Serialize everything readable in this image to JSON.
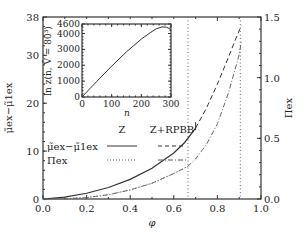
{
  "chart_data": {
    "type": "line",
    "title": "",
    "xlabel": "φ",
    "ylabel_left": "μ̃ex − μ̃1ex",
    "ylabel_right": "Πex",
    "xlim": [
      0.0,
      1.0
    ],
    "ylim_left": [
      0,
      38
    ],
    "ylim_right": [
      0.0,
      1.5
    ],
    "x_ticks": [
      "0.0",
      "0.2",
      "0.4",
      "0.6",
      "0.8",
      "1.0"
    ],
    "y_left_ticks": [
      "0",
      "10",
      "20",
      "30",
      "38"
    ],
    "y_right_ticks": [
      "0.0",
      "0.5",
      "1.0",
      "1.5"
    ],
    "grid": false,
    "vertical_lines": [
      {
        "x": 0.665,
        "style": "dotted"
      },
      {
        "x": 0.905,
        "style": "dotted"
      }
    ],
    "legend": {
      "position": "upper-left",
      "columns": [
        "Z",
        "Z+RPBB"
      ],
      "rows": [
        "μ̃ex−μ̃1ex",
        "Πex"
      ]
    },
    "series": [
      {
        "name": "μ̃ex−μ̃1ex (Z)",
        "axis": "left",
        "style": "solid",
        "x": [
          0.0,
          0.1,
          0.2,
          0.3,
          0.4,
          0.5,
          0.6,
          0.65,
          0.7
        ],
        "y": [
          0.0,
          0.4,
          1.2,
          2.4,
          4.1,
          6.4,
          9.6,
          11.8,
          14.8
        ]
      },
      {
        "name": "μ̃ex−μ̃1ex (Z+RPBB)",
        "axis": "left",
        "style": "dashed",
        "x": [
          0.7,
          0.75,
          0.8,
          0.85,
          0.88,
          0.91
        ],
        "y": [
          14.8,
          19.0,
          24.0,
          29.5,
          33.0,
          36.2
        ]
      },
      {
        "name": "Πex (Z)",
        "axis": "right",
        "style": "dotted",
        "x": [
          0.0,
          0.1,
          0.2,
          0.3,
          0.4,
          0.5,
          0.6,
          0.665
        ],
        "y": [
          0.0,
          0.002,
          0.012,
          0.035,
          0.075,
          0.13,
          0.21,
          0.27
        ]
      },
      {
        "name": "Πex (Z+RPBB)",
        "axis": "right",
        "style": "dashdot",
        "x": [
          0.0,
          0.1,
          0.2,
          0.3,
          0.4,
          0.5,
          0.6,
          0.665,
          0.7,
          0.75,
          0.8,
          0.85,
          0.9,
          0.91
        ],
        "y": [
          0.0,
          0.002,
          0.012,
          0.035,
          0.075,
          0.13,
          0.21,
          0.27,
          0.33,
          0.45,
          0.62,
          0.87,
          1.19,
          1.3
        ]
      }
    ],
    "inset": {
      "type": "line",
      "xlabel": "n",
      "ylabel": "ln z(n, V̄ = 80³)",
      "xlim": [
        0,
        300
      ],
      "ylim": [
        0,
        4600
      ],
      "x_ticks": [
        "0",
        "100",
        "200",
        "300"
      ],
      "y_ticks": [
        "0",
        "1000",
        "2000",
        "3000",
        "4000",
        "4600"
      ],
      "series": [
        {
          "name": "ln z",
          "style": "solid",
          "x": [
            0,
            25,
            50,
            100,
            150,
            200,
            230,
            250,
            270,
            285,
            300
          ],
          "y": [
            0,
            500,
            980,
            1950,
            2850,
            3650,
            4050,
            4300,
            4420,
            4400,
            4250
          ]
        }
      ]
    }
  },
  "labels": {
    "x_axis": "φ",
    "y_left": "μ̃ex−μ̃1ex",
    "y_right": "Πex",
    "inset_x": "n",
    "inset_y": "ln z(n, V̄ = 80³)",
    "legend_col1": "Z",
    "legend_col2": "Z+RPBB",
    "legend_row1": "μ̃ex−μ̃1ex",
    "legend_row2": "Πex"
  }
}
